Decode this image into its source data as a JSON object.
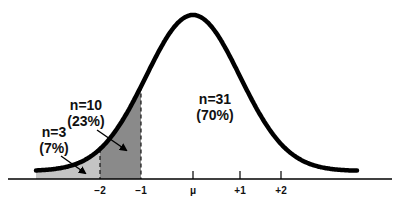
{
  "diagram": {
    "type": "normal-distribution",
    "mean_label": "μ",
    "ticks": [
      {
        "label": "−2",
        "x": 100
      },
      {
        "label": "−1",
        "x": 141
      },
      {
        "label": "μ",
        "x": 193
      },
      {
        "label": "+1",
        "x": 240
      },
      {
        "label": "+2",
        "x": 281
      }
    ],
    "regions": [
      {
        "n": "n=3",
        "pct": "(7%)",
        "range": "below −2",
        "color": "#c4c4c4"
      },
      {
        "n": "n=10",
        "pct": "(23%)",
        "range": "−2 to −1",
        "color": "#8a8a8a"
      },
      {
        "n": "n=31",
        "pct": "(70%)",
        "range": "above −1",
        "color": "#ffffff"
      }
    ]
  }
}
